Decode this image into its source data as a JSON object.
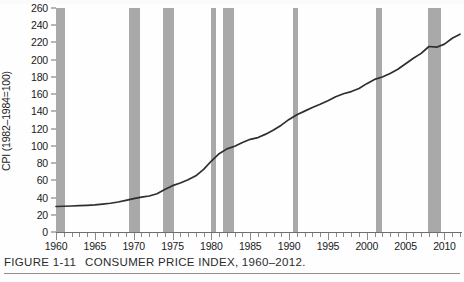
{
  "figure": {
    "number": "FIGURE 1-11",
    "caption": "CONSUMER PRICE INDEX, 1960–2012."
  },
  "axes": {
    "y_label": "CPI (1982–1984=100)",
    "y_ticks": [
      0,
      20,
      40,
      60,
      80,
      100,
      120,
      140,
      160,
      180,
      200,
      220,
      240,
      260
    ],
    "x_ticks": [
      1960,
      1965,
      1970,
      1975,
      1980,
      1985,
      1990,
      1995,
      2000,
      2005,
      2010
    ]
  },
  "colors": {
    "recession_band": "#a9a9a9",
    "series_line": "#2e2e2e",
    "axis": "#6e6e6e",
    "background": "#fefefe"
  },
  "chart_data": {
    "type": "line",
    "title": "CONSUMER PRICE INDEX, 1960–2012.",
    "xlabel": "",
    "ylabel": "CPI (1982–1984=100)",
    "xlim": [
      1960,
      2012
    ],
    "ylim": [
      0,
      260
    ],
    "grid": false,
    "legend": "none",
    "x": [
      1960,
      1961,
      1962,
      1963,
      1964,
      1965,
      1966,
      1967,
      1968,
      1969,
      1970,
      1971,
      1972,
      1973,
      1974,
      1975,
      1976,
      1977,
      1978,
      1979,
      1980,
      1981,
      1982,
      1983,
      1984,
      1985,
      1986,
      1987,
      1988,
      1989,
      1990,
      1991,
      1992,
      1993,
      1994,
      1995,
      1996,
      1997,
      1998,
      1999,
      2000,
      2001,
      2002,
      2003,
      2004,
      2005,
      2006,
      2007,
      2008,
      2009,
      2010,
      2011,
      2012
    ],
    "values": [
      29.6,
      29.9,
      30.2,
      30.6,
      31.0,
      31.5,
      32.4,
      33.4,
      34.8,
      36.7,
      38.8,
      40.5,
      41.8,
      44.4,
      49.3,
      53.8,
      56.9,
      60.6,
      65.2,
      72.6,
      82.4,
      90.9,
      96.5,
      99.6,
      103.9,
      107.6,
      109.6,
      113.6,
      118.3,
      124.0,
      130.7,
      136.2,
      140.3,
      144.5,
      148.2,
      152.4,
      156.9,
      160.5,
      163.0,
      166.6,
      172.2,
      177.1,
      179.9,
      184.0,
      188.9,
      195.3,
      201.6,
      207.3,
      215.3,
      214.5,
      218.1,
      224.9,
      229.6
    ],
    "series": [
      {
        "name": "Consumer Price Index (CPI-U)",
        "values": [
          29.6,
          29.9,
          30.2,
          30.6,
          31.0,
          31.5,
          32.4,
          33.4,
          34.8,
          36.7,
          38.8,
          40.5,
          41.8,
          44.4,
          49.3,
          53.8,
          56.9,
          60.6,
          65.2,
          72.6,
          82.4,
          90.9,
          96.5,
          99.6,
          103.9,
          107.6,
          109.6,
          113.6,
          118.3,
          124.0,
          130.7,
          136.2,
          140.3,
          144.5,
          148.2,
          152.4,
          156.9,
          160.5,
          163.0,
          166.6,
          172.2,
          177.1,
          179.9,
          184.0,
          188.9,
          195.3,
          201.6,
          207.3,
          215.3,
          214.5,
          218.1,
          224.9,
          229.6
        ]
      }
    ],
    "annotations": [
      {
        "type": "recession-band",
        "label": "1960–1961 recession",
        "start": 1960.0,
        "end": 1961.2
      },
      {
        "type": "recession-band",
        "label": "1969–1970 recession",
        "start": 1969.4,
        "end": 1970.8
      },
      {
        "type": "recession-band",
        "label": "1973–1975 recession",
        "start": 1973.8,
        "end": 1975.2
      },
      {
        "type": "recession-band",
        "label": "1980 recession",
        "start": 1980.0,
        "end": 1980.6
      },
      {
        "type": "recession-band",
        "label": "1981–1982 recession",
        "start": 1981.5,
        "end": 1982.9
      },
      {
        "type": "recession-band",
        "label": "1990–1991 recession",
        "start": 1990.5,
        "end": 1991.2
      },
      {
        "type": "recession-band",
        "label": "2001 recession",
        "start": 2001.2,
        "end": 2001.9
      },
      {
        "type": "recession-band",
        "label": "2007–2009 recession",
        "start": 2007.9,
        "end": 2009.5
      }
    ]
  }
}
